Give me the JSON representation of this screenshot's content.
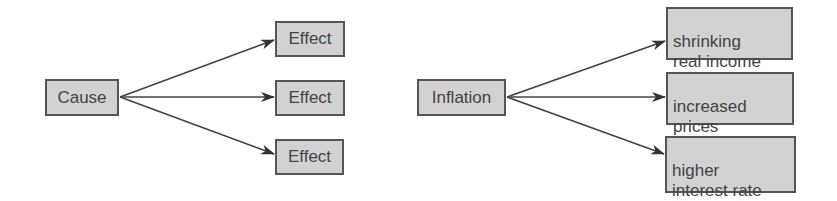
{
  "left_diagram": {
    "cause": "Cause",
    "effects": [
      "Effect",
      "Effect",
      "Effect"
    ]
  },
  "right_diagram": {
    "cause": "Inflation",
    "effects": [
      "shrinking\nreal income",
      "increased\nprices",
      "higher\ninterest rate"
    ]
  },
  "colors": {
    "box_fill": "#d2d2d2",
    "box_border": "#555555",
    "text": "#444444",
    "arrow": "#333333"
  }
}
